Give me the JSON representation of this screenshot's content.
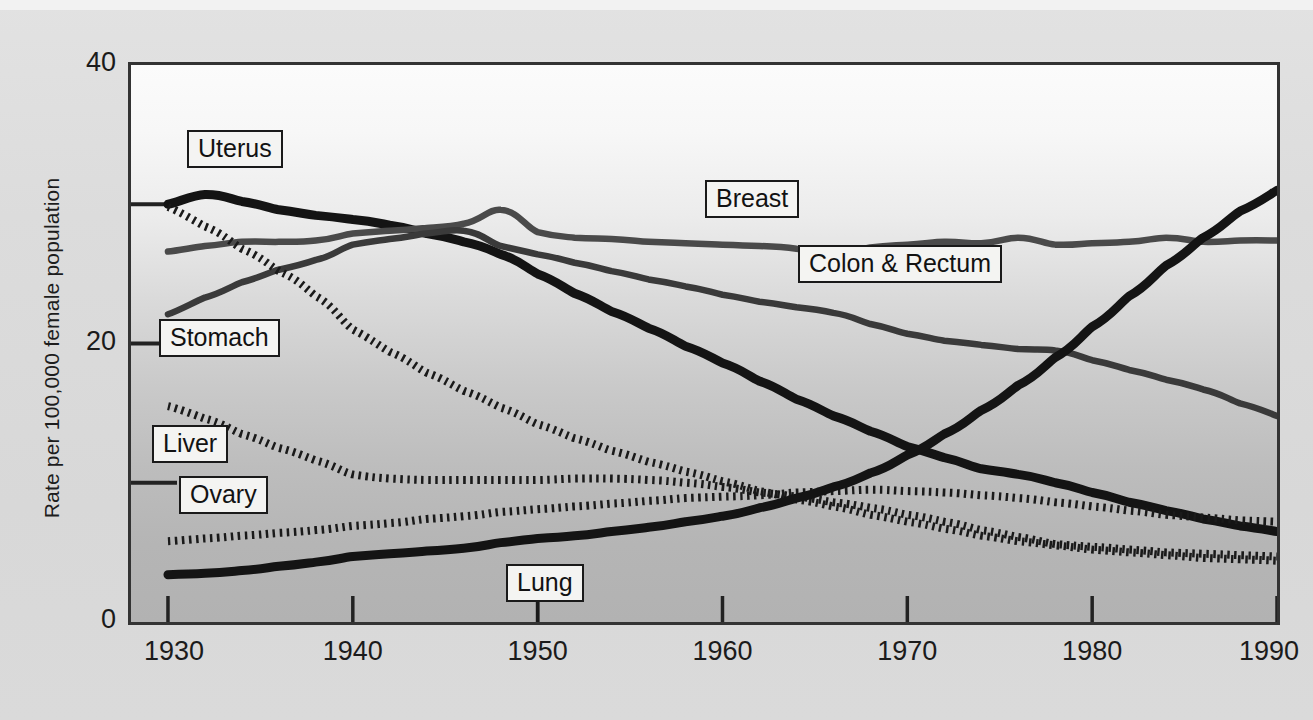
{
  "chart_data": {
    "type": "line",
    "title": "",
    "xlabel": "",
    "ylabel": "Rate per 100,000 female population",
    "xlim": [
      1928,
      1990
    ],
    "ylim": [
      0,
      40
    ],
    "xticks": [
      "1930",
      "1940",
      "1950",
      "1960",
      "1970",
      "1980",
      "1990"
    ],
    "xtick_values": [
      1930,
      1940,
      1950,
      1960,
      1970,
      1980,
      1990
    ],
    "yticks": [
      "0",
      "20",
      "40"
    ],
    "ytick_values": [
      0,
      20,
      40
    ],
    "minor_ytick_values": [
      10,
      30
    ],
    "grid": false,
    "legend_position": "inline-labels",
    "x": [
      1930,
      1932,
      1934,
      1936,
      1938,
      1940,
      1942,
      1944,
      1946,
      1948,
      1950,
      1952,
      1954,
      1956,
      1958,
      1960,
      1962,
      1964,
      1966,
      1968,
      1970,
      1972,
      1974,
      1976,
      1978,
      1980,
      1982,
      1984,
      1986,
      1988,
      1990
    ],
    "series": [
      {
        "name": "Uterus",
        "style": "solid-heavy",
        "color": "#141414",
        "values": [
          30.0,
          30.7,
          30.2,
          29.6,
          29.2,
          28.9,
          28.5,
          27.9,
          27.3,
          26.4,
          25.0,
          23.6,
          22.3,
          21.1,
          19.8,
          18.6,
          17.3,
          16.0,
          14.8,
          13.7,
          12.6,
          11.8,
          11.0,
          10.6,
          10.0,
          9.3,
          8.6,
          8.0,
          7.4,
          6.9,
          6.5
        ]
      },
      {
        "name": "Breast",
        "style": "solid-medium",
        "color": "#4a4a4a",
        "values": [
          26.6,
          27.0,
          27.3,
          27.3,
          27.4,
          27.9,
          28.1,
          28.3,
          28.6,
          29.6,
          28.0,
          27.6,
          27.5,
          27.3,
          27.2,
          27.1,
          27.0,
          26.8,
          26.3,
          26.9,
          27.1,
          27.3,
          27.2,
          27.6,
          27.1,
          27.2,
          27.3,
          27.6,
          27.3,
          27.4,
          27.4
        ]
      },
      {
        "name": "Colon & Rectum",
        "style": "solid-medium",
        "color": "#3a3a3a",
        "values": [
          22.1,
          23.3,
          24.4,
          25.3,
          26.0,
          27.1,
          27.5,
          27.9,
          28.1,
          27.0,
          26.4,
          25.8,
          25.2,
          24.6,
          24.1,
          23.5,
          23.0,
          22.6,
          22.2,
          21.4,
          20.7,
          20.2,
          19.9,
          19.6,
          19.5,
          18.8,
          18.1,
          17.4,
          16.7,
          15.7,
          14.8
        ]
      },
      {
        "name": "Stomach",
        "style": "dotted",
        "color": "#1a1a1a",
        "values": [
          29.8,
          28.4,
          26.8,
          25.2,
          23.4,
          21.0,
          19.4,
          17.9,
          16.6,
          15.4,
          14.2,
          13.2,
          12.3,
          11.5,
          10.8,
          10.1,
          9.4,
          8.8,
          8.3,
          7.7,
          7.2,
          6.7,
          6.2,
          5.8,
          5.5,
          5.2,
          5.0,
          4.8,
          4.6,
          4.5,
          4.4
        ]
      },
      {
        "name": "Liver",
        "style": "dotted",
        "color": "#1a1a1a",
        "values": [
          15.5,
          14.6,
          13.5,
          12.5,
          11.6,
          10.6,
          10.3,
          10.2,
          10.2,
          10.2,
          10.2,
          10.3,
          10.3,
          10.2,
          10.0,
          9.7,
          9.3,
          9.0,
          8.6,
          8.2,
          7.7,
          7.2,
          6.6,
          6.1,
          5.6,
          5.4,
          5.2,
          5.0,
          4.9,
          4.8,
          4.7
        ]
      },
      {
        "name": "Ovary",
        "style": "dotted",
        "color": "#1a1a1a",
        "values": [
          5.8,
          6.0,
          6.2,
          6.4,
          6.6,
          6.9,
          7.1,
          7.4,
          7.6,
          7.9,
          8.1,
          8.3,
          8.5,
          8.7,
          8.9,
          9.0,
          9.1,
          9.3,
          9.4,
          9.5,
          9.4,
          9.3,
          9.1,
          8.9,
          8.6,
          8.3,
          8.0,
          7.7,
          7.5,
          7.3,
          7.2
        ]
      },
      {
        "name": "Lung",
        "style": "solid-heavy",
        "color": "#141414",
        "values": [
          3.4,
          3.5,
          3.7,
          4.0,
          4.3,
          4.7,
          4.9,
          5.1,
          5.3,
          5.7,
          6.0,
          6.2,
          6.5,
          6.8,
          7.2,
          7.6,
          8.2,
          8.9,
          9.7,
          10.7,
          12.0,
          13.5,
          15.2,
          17.0,
          19.0,
          21.2,
          23.4,
          25.6,
          27.6,
          29.5,
          31.0
        ]
      }
    ],
    "annotations": [
      {
        "text": "Uterus",
        "x": 1933.6,
        "y": 34.0
      },
      {
        "text": "Stomach",
        "x": 1932.8,
        "y": 20.4
      },
      {
        "text": "Liver",
        "x": 1931.2,
        "y": 12.8
      },
      {
        "text": "Ovary",
        "x": 1933.0,
        "y": 9.1
      },
      {
        "text": "Lung",
        "x": 1950.4,
        "y": 2.8
      },
      {
        "text": "Breast",
        "x": 1961.6,
        "y": 30.4
      },
      {
        "text": "Colon & Rectum",
        "x": 1969.6,
        "y": 25.7
      }
    ]
  },
  "axis": {
    "ylabel": "Rate per 100,000 female population"
  },
  "colors": {
    "heavy_line": "#141414",
    "medium_line": "#4a4a4a",
    "border": "#333333",
    "label_box_bg": "#f4f4f2",
    "label_box_border": "#1a1a1a",
    "page_bg": "#dcdcdc"
  }
}
